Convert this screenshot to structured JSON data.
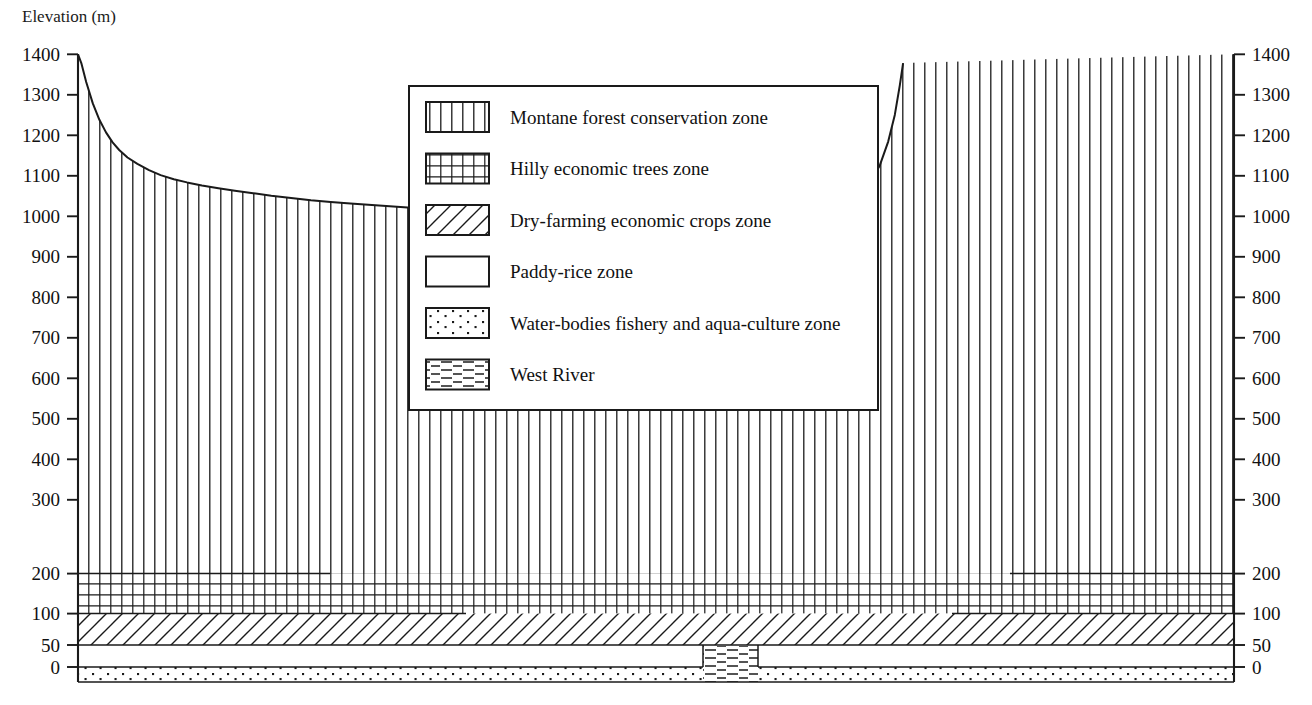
{
  "axis_title": "Elevation (m)",
  "axis": {
    "left_ticks": [
      "1400",
      "1300",
      "1200",
      "1100",
      "1000",
      "900",
      "800",
      "700",
      "600",
      "500",
      "400",
      "300",
      "200",
      "100",
      "50",
      "0"
    ],
    "right_ticks": [
      "1400",
      "1300",
      "1200",
      "1100",
      "1000",
      "900",
      "800",
      "700",
      "600",
      "500",
      "400",
      "300",
      "200",
      "100",
      "50",
      "0"
    ]
  },
  "legend": {
    "items": [
      {
        "label": "Montane forest conservation zone",
        "pattern": "vertical-lines-pattern"
      },
      {
        "label": "Hilly economic trees zone",
        "pattern": "grid-pattern"
      },
      {
        "label": "Dry-farming economic crops zone",
        "pattern": "diagonal-lines-pattern"
      },
      {
        "label": "Paddy-rice zone",
        "pattern": "blank-pattern"
      },
      {
        "label": "Water-bodies fishery and aqua-culture zone",
        "pattern": "dots-pattern"
      },
      {
        "label": "West River",
        "pattern": "horizontal-dashes-pattern"
      }
    ]
  },
  "chart_data": {
    "type": "area",
    "title": "",
    "ylabel": "Elevation (m)",
    "xlabel": "",
    "ylim": [
      0,
      1400
    ],
    "y_ticks": [
      0,
      50,
      100,
      200,
      300,
      400,
      500,
      600,
      700,
      800,
      900,
      1000,
      1100,
      1200,
      1300,
      1400
    ],
    "grid": false,
    "legend_position": "upper-center",
    "zone_boundaries_m": {
      "montane_forest_lower": 200,
      "hilly_trees_range": [
        100,
        200
      ],
      "dry_farming_range": [
        50,
        100
      ],
      "paddy_rice_range": [
        0,
        50
      ],
      "water_bodies_top": 0,
      "west_river_top": 0
    },
    "series": [
      {
        "name": "Terrain surface elevation (m)",
        "note": "x is relative position across the valley transect, 0 = left edge, 1 = right edge",
        "x": [
          0.0,
          0.004,
          0.01,
          0.018,
          0.026,
          0.034,
          0.042,
          0.05,
          0.06,
          0.072,
          0.086,
          0.1,
          0.116,
          0.132,
          0.15,
          0.17,
          0.19,
          0.212,
          0.234,
          0.258,
          0.282,
          0.306,
          0.33,
          0.356,
          0.382,
          0.408,
          0.434,
          0.46,
          0.486,
          0.512,
          0.536,
          0.552,
          0.56,
          0.566,
          0.572,
          0.578,
          0.59,
          0.604,
          0.62,
          0.64,
          0.66,
          0.68,
          0.7,
          0.72,
          0.74,
          0.76,
          0.78,
          0.8,
          0.82,
          0.84,
          0.86,
          0.88,
          0.9,
          0.918,
          0.934,
          0.948,
          0.96,
          0.972,
          0.982,
          0.99,
          0.996,
          1.0
        ],
        "y": [
          1400,
          1330,
          1180,
          1010,
          880,
          780,
          700,
          640,
          580,
          530,
          480,
          440,
          408,
          382,
          358,
          336,
          316,
          296,
          276,
          258,
          240,
          226,
          212,
          200,
          188,
          176,
          164,
          150,
          136,
          124,
          112,
          104,
          98,
          90,
          78,
          62,
          52,
          48,
          44,
          42,
          40,
          38,
          36,
          34,
          33,
          32,
          34,
          38,
          44,
          52,
          62,
          76,
          96,
          124,
          160,
          214,
          300,
          420,
          580,
          760,
          960,
          1100
        ]
      }
    ],
    "annotations": [
      {
        "text": "West River channel incised at valley centre",
        "x_range": [
          0.476,
          0.518
        ]
      }
    ]
  }
}
